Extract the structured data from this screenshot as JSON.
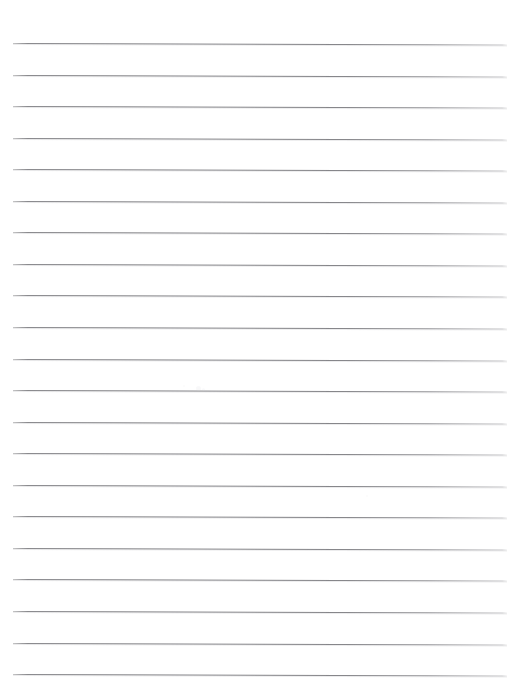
{
  "document": {
    "type": "ruled-paper-scan",
    "title": "Blank ruled notebook paper",
    "page_width": 514,
    "page_height": 689,
    "background_color": "#ffffff",
    "rule_color": "#808084",
    "text_content": "",
    "has_text": false,
    "has_margin_rule": false,
    "orientation": "portrait"
  },
  "ruling": {
    "line_count": 21,
    "first_line_y": 43,
    "line_spacing": 31.55,
    "line_thickness": 1,
    "line_start_x": 13,
    "line_end_x": 507,
    "slant_degrees": 0.18,
    "line_ys": [
      43.0,
      74.6,
      106.1,
      137.7,
      169.2,
      200.8,
      232.3,
      263.9,
      295.4,
      327.0,
      358.5,
      390.1,
      421.6,
      453.2,
      484.7,
      516.3,
      547.8,
      579.4,
      610.9,
      642.5,
      674.0
    ]
  },
  "artifacts": {
    "specks": [
      {
        "x": 196,
        "y": 386,
        "size": 5,
        "opacity": 0.3
      },
      {
        "x": 202,
        "y": 388,
        "size": 3,
        "opacity": 0.22
      },
      {
        "x": 183,
        "y": 385,
        "size": 2,
        "opacity": 0.18
      },
      {
        "x": 366,
        "y": 495,
        "size": 2,
        "opacity": 0.14
      }
    ]
  }
}
